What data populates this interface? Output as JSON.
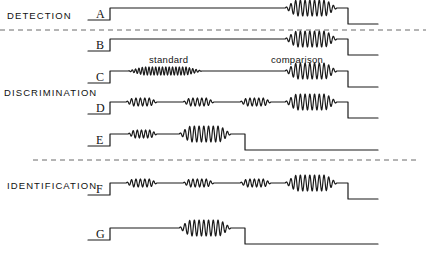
{
  "figure": {
    "width": 426,
    "height": 253,
    "background": "#ffffff",
    "stroke_color": "#1a1a1a",
    "dash_color": "#6b6b6b"
  },
  "category_labels": [
    {
      "id": "detection",
      "text": "DETECTION",
      "x": 7,
      "y": 10
    },
    {
      "id": "discrimination",
      "text": "DISCRIMINATION",
      "x": 4,
      "y": 87
    },
    {
      "id": "identification",
      "text": "IDENTIFICATION",
      "x": 7,
      "y": 180
    }
  ],
  "segment_labels": [
    {
      "id": "standard",
      "text": "standard",
      "x": 149,
      "y": 54
    },
    {
      "id": "comparison",
      "text": "comparison",
      "x": 271,
      "y": 54
    }
  ],
  "trace_labels": [
    {
      "id": "A",
      "text": "A",
      "x": 96,
      "y": 7
    },
    {
      "id": "B",
      "text": "B",
      "x": 96,
      "y": 38
    },
    {
      "id": "C",
      "text": "C",
      "x": 96,
      "y": 70
    },
    {
      "id": "D",
      "text": "D",
      "x": 96,
      "y": 101
    },
    {
      "id": "E",
      "text": "E",
      "x": 96,
      "y": 133
    },
    {
      "id": "F",
      "text": "F",
      "x": 96,
      "y": 182
    },
    {
      "id": "G",
      "text": "G",
      "x": 96,
      "y": 227
    }
  ],
  "dashed_separators": [
    {
      "id": "detection-discrimination",
      "x1": 0,
      "y1": 30,
      "x2": 426,
      "y2": 30
    },
    {
      "id": "discrimination-identification",
      "x1": 33,
      "y1": 160,
      "x2": 420,
      "y2": 160
    }
  ],
  "chart_data": {
    "type": "line",
    "title": "",
    "xlabel": "",
    "ylabel": "",
    "traces": [
      {
        "name": "A",
        "category": "DETECTION",
        "baseline_y": 20,
        "top_y": 8,
        "tail_y": 24,
        "onset_x": 110,
        "offset_x": 348,
        "end_x": 378,
        "bursts": [
          {
            "label": "comparison",
            "x_start": 285,
            "x_end": 337,
            "cycles": 11,
            "amplitude": 8
          }
        ]
      },
      {
        "name": "B",
        "category": "DETECTION",
        "baseline_y": 51,
        "top_y": 39,
        "tail_y": 55,
        "onset_x": 110,
        "offset_x": 348,
        "end_x": 378,
        "bursts": [
          {
            "label": "comparison",
            "x_start": 285,
            "x_end": 337,
            "cycles": 11,
            "amplitude": 8
          }
        ]
      },
      {
        "name": "C",
        "category": "DISCRIMINATION",
        "baseline_y": 83,
        "top_y": 71,
        "tail_y": 87,
        "onset_x": 110,
        "offset_x": 348,
        "end_x": 378,
        "bursts": [
          {
            "label": "standard",
            "x_start": 128,
            "x_end": 202,
            "cycles": 22,
            "amplitude": 4
          },
          {
            "label": "comparison",
            "x_start": 285,
            "x_end": 337,
            "cycles": 11,
            "amplitude": 8
          }
        ]
      },
      {
        "name": "D",
        "category": "DISCRIMINATION",
        "baseline_y": 114,
        "top_y": 102,
        "tail_y": 118,
        "onset_x": 110,
        "offset_x": 348,
        "end_x": 378,
        "bursts": [
          {
            "label": "standard-1",
            "x_start": 126,
            "x_end": 157,
            "cycles": 7,
            "amplitude": 4
          },
          {
            "label": "standard-2",
            "x_start": 183,
            "x_end": 214,
            "cycles": 7,
            "amplitude": 4
          },
          {
            "label": "standard-3",
            "x_start": 240,
            "x_end": 271,
            "cycles": 7,
            "amplitude": 4
          },
          {
            "label": "comparison",
            "x_start": 285,
            "x_end": 337,
            "cycles": 11,
            "amplitude": 8
          }
        ]
      },
      {
        "name": "E",
        "category": "DISCRIMINATION",
        "baseline_y": 146,
        "top_y": 134,
        "tail_y": 150,
        "onset_x": 110,
        "offset_x": 245,
        "end_x": 378,
        "bursts": [
          {
            "label": "standard",
            "x_start": 128,
            "x_end": 157,
            "cycles": 7,
            "amplitude": 4
          },
          {
            "label": "comparison",
            "x_start": 179,
            "x_end": 231,
            "cycles": 11,
            "amplitude": 8
          }
        ]
      },
      {
        "name": "F",
        "category": "IDENTIFICATION",
        "baseline_y": 195,
        "top_y": 183,
        "tail_y": 199,
        "onset_x": 110,
        "offset_x": 348,
        "end_x": 378,
        "bursts": [
          {
            "label": "standard-1",
            "x_start": 126,
            "x_end": 157,
            "cycles": 7,
            "amplitude": 4
          },
          {
            "label": "standard-2",
            "x_start": 183,
            "x_end": 214,
            "cycles": 7,
            "amplitude": 4
          },
          {
            "label": "standard-3",
            "x_start": 240,
            "x_end": 271,
            "cycles": 7,
            "amplitude": 4
          },
          {
            "label": "comparison",
            "x_start": 285,
            "x_end": 337,
            "cycles": 11,
            "amplitude": 8
          }
        ]
      },
      {
        "name": "G",
        "category": "IDENTIFICATION",
        "baseline_y": 240,
        "top_y": 228,
        "tail_y": 244,
        "onset_x": 110,
        "offset_x": 245,
        "end_x": 378,
        "bursts": [
          {
            "label": "comparison",
            "x_start": 179,
            "x_end": 231,
            "cycles": 11,
            "amplitude": 8
          }
        ]
      }
    ]
  }
}
